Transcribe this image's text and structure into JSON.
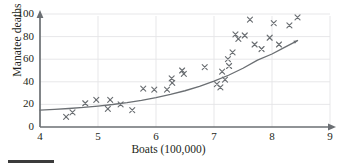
{
  "chart_data": {
    "type": "scatter",
    "title": "",
    "xlabel": "Boats (100,000)",
    "ylabel": "Manatee deaths",
    "xlim": [
      4,
      9
    ],
    "ylim": [
      0,
      100
    ],
    "xticks": [
      4,
      5,
      6,
      7,
      8,
      9
    ],
    "yticks": [
      0,
      20,
      40,
      60,
      80,
      100
    ],
    "grid": true,
    "legend": "none",
    "marker": "x",
    "marker_color": "#6b6f73",
    "curve_color": "#6b6f73",
    "points": [
      {
        "x": 4.45,
        "y": 9
      },
      {
        "x": 4.56,
        "y": 13
      },
      {
        "x": 4.78,
        "y": 21
      },
      {
        "x": 4.97,
        "y": 24
      },
      {
        "x": 5.17,
        "y": 16
      },
      {
        "x": 5.21,
        "y": 24
      },
      {
        "x": 5.39,
        "y": 20
      },
      {
        "x": 5.59,
        "y": 15
      },
      {
        "x": 5.78,
        "y": 34
      },
      {
        "x": 5.97,
        "y": 33
      },
      {
        "x": 6.19,
        "y": 33
      },
      {
        "x": 6.28,
        "y": 39
      },
      {
        "x": 6.27,
        "y": 43
      },
      {
        "x": 6.45,
        "y": 50
      },
      {
        "x": 6.48,
        "y": 47
      },
      {
        "x": 6.84,
        "y": 53
      },
      {
        "x": 7.05,
        "y": 38
      },
      {
        "x": 7.11,
        "y": 35
      },
      {
        "x": 7.14,
        "y": 49
      },
      {
        "x": 7.19,
        "y": 42
      },
      {
        "x": 7.24,
        "y": 60
      },
      {
        "x": 7.26,
        "y": 54
      },
      {
        "x": 7.32,
        "y": 66
      },
      {
        "x": 7.37,
        "y": 82
      },
      {
        "x": 7.42,
        "y": 78
      },
      {
        "x": 7.53,
        "y": 81
      },
      {
        "x": 7.62,
        "y": 95
      },
      {
        "x": 7.7,
        "y": 73
      },
      {
        "x": 7.82,
        "y": 69
      },
      {
        "x": 7.96,
        "y": 79
      },
      {
        "x": 8.03,
        "y": 92
      },
      {
        "x": 8.12,
        "y": 73
      },
      {
        "x": 8.3,
        "y": 90
      },
      {
        "x": 8.44,
        "y": 97
      }
    ],
    "fit_curve": {
      "label": "fitted exponential trend",
      "points": [
        {
          "x": 4.0,
          "y": 15.0
        },
        {
          "x": 4.25,
          "y": 15.6
        },
        {
          "x": 4.5,
          "y": 16.4
        },
        {
          "x": 4.75,
          "y": 17.3
        },
        {
          "x": 5.0,
          "y": 18.5
        },
        {
          "x": 5.25,
          "y": 19.9
        },
        {
          "x": 5.5,
          "y": 21.6
        },
        {
          "x": 5.75,
          "y": 23.6
        },
        {
          "x": 6.0,
          "y": 26.0
        },
        {
          "x": 6.25,
          "y": 28.8
        },
        {
          "x": 6.5,
          "y": 32.1
        },
        {
          "x": 6.75,
          "y": 36.0
        },
        {
          "x": 7.0,
          "y": 40.5
        },
        {
          "x": 7.25,
          "y": 45.8
        },
        {
          "x": 7.5,
          "y": 52.0
        },
        {
          "x": 7.75,
          "y": 59.2
        },
        {
          "x": 8.0,
          "y": 64.6
        },
        {
          "x": 8.2,
          "y": 70.0
        },
        {
          "x": 8.44,
          "y": 76.5
        }
      ]
    }
  }
}
